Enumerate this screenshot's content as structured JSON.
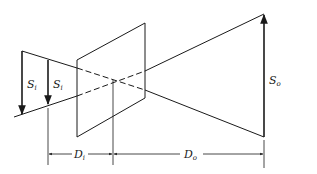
{
  "diagram": {
    "type": "optical projection geometry",
    "labels": {
      "image_size_1": {
        "main": "S",
        "sub": "i"
      },
      "image_size_2": {
        "main": "S",
        "sub": "i"
      },
      "object_size": {
        "main": "S",
        "sub": "o"
      },
      "image_distance": {
        "main": "D",
        "sub": "i"
      },
      "object_distance": {
        "main": "D",
        "sub": "o"
      }
    },
    "colors": {
      "line": "#1a1a1a",
      "background": "#ffffff"
    }
  }
}
